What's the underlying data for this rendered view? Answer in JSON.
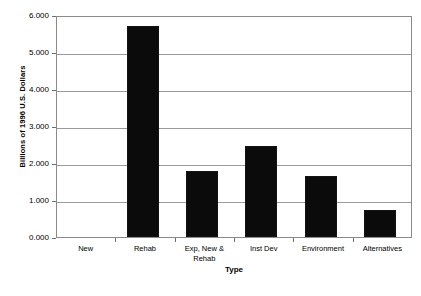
{
  "chart_data": {
    "type": "bar",
    "title": "",
    "xlabel": "Type",
    "ylabel": "Billions of 1996 U.S. Dollars",
    "categories": [
      "New",
      "Rehab",
      "Exp, New &\nRehab",
      "Inst Dev",
      "Environment",
      "Alternatives"
    ],
    "values": [
      5.7,
      1.78,
      2.47,
      1.64,
      0.72,
      0.78
    ],
    "ylim": [
      0,
      6
    ],
    "ytick_labels": [
      "0.000",
      "1.000",
      "2.000",
      "3.000",
      "4.000",
      "5.000",
      "6.000"
    ],
    "ytick_values": [
      0,
      1,
      2,
      3,
      4,
      5,
      6
    ],
    "grid": true,
    "legend": false,
    "bar_color": "#0b0b0b",
    "grid_color": "#9a9a9a",
    "frame_color": "#8a8a8a",
    "background": "#ffffff"
  }
}
